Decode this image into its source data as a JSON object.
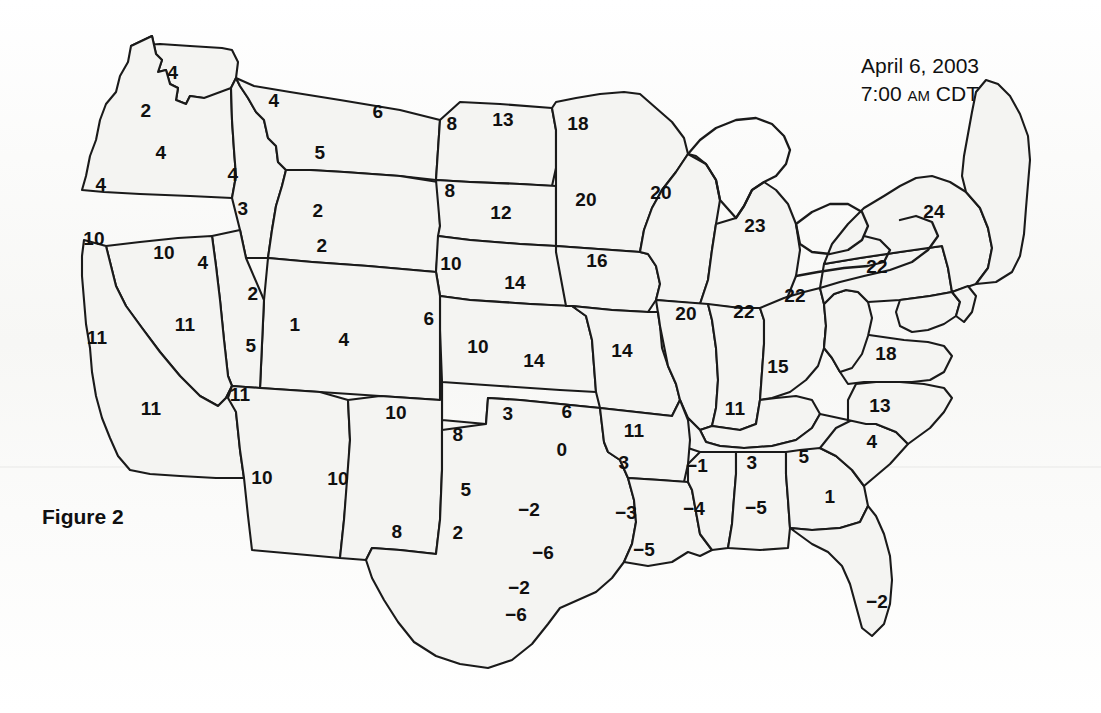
{
  "figure": {
    "caption": "Figure 2"
  },
  "header": {
    "date": "April 6, 2003",
    "time_value": "7:00",
    "time_meridiem": "AM",
    "time_zone": "CDT"
  },
  "chart_data": {
    "type": "map",
    "title": "April 6, 2003 7:00 AM CDT",
    "subtitle": "Figure 2",
    "region": "Contiguous United States",
    "projection": "albers-usa",
    "value_type": "station observation",
    "grid": false,
    "legend": null,
    "colors": {
      "land_fill": "#f4f4f2",
      "border_stroke": "#1a1a1a",
      "label_text": "#101010",
      "background": "#fdfdfc"
    },
    "labels": [
      {
        "id": "wa-n",
        "value": "4",
        "x": 173,
        "y": 72
      },
      {
        "id": "wa-w",
        "value": "2",
        "x": 146,
        "y": 110
      },
      {
        "id": "or-ne",
        "value": "4",
        "x": 161,
        "y": 152
      },
      {
        "id": "or-w",
        "value": "4",
        "x": 101,
        "y": 184
      },
      {
        "id": "id-n",
        "value": "4",
        "x": 233,
        "y": 174
      },
      {
        "id": "id-s",
        "value": "3",
        "x": 243,
        "y": 208
      },
      {
        "id": "mt-w",
        "value": "4",
        "x": 274,
        "y": 100
      },
      {
        "id": "mt-c",
        "value": "5",
        "x": 320,
        "y": 152
      },
      {
        "id": "mt-e",
        "value": "6",
        "x": 378,
        "y": 111
      },
      {
        "id": "nd-w",
        "value": "8",
        "x": 452,
        "y": 123
      },
      {
        "id": "nd-e",
        "value": "13",
        "x": 503,
        "y": 119
      },
      {
        "id": "mn-n",
        "value": "18",
        "x": 578,
        "y": 123
      },
      {
        "id": "sd-w",
        "value": "8",
        "x": 450,
        "y": 190
      },
      {
        "id": "sd-e",
        "value": "12",
        "x": 501,
        "y": 212
      },
      {
        "id": "mn-s",
        "value": "20",
        "x": 586,
        "y": 199
      },
      {
        "id": "wi-w",
        "value": "20",
        "x": 661,
        "y": 192
      },
      {
        "id": "mi-c",
        "value": "23",
        "x": 755,
        "y": 225
      },
      {
        "id": "ny-c",
        "value": "24",
        "x": 934,
        "y": 211
      },
      {
        "id": "ca-n",
        "value": "10",
        "x": 94,
        "y": 238
      },
      {
        "id": "nv-n",
        "value": "10",
        "x": 164,
        "y": 252
      },
      {
        "id": "ut-nw",
        "value": "4",
        "x": 203,
        "y": 262
      },
      {
        "id": "wy-w",
        "value": "2",
        "x": 318,
        "y": 210
      },
      {
        "id": "wy-sw",
        "value": "2",
        "x": 322,
        "y": 245
      },
      {
        "id": "ne-w",
        "value": "10",
        "x": 451,
        "y": 263
      },
      {
        "id": "ne-e",
        "value": "14",
        "x": 515,
        "y": 282
      },
      {
        "id": "ia-c",
        "value": "16",
        "x": 597,
        "y": 260
      },
      {
        "id": "pa-c",
        "value": "22",
        "x": 877,
        "y": 266
      },
      {
        "id": "ut-n",
        "value": "2",
        "x": 253,
        "y": 293
      },
      {
        "id": "ut-c",
        "value": "5",
        "x": 251,
        "y": 345
      },
      {
        "id": "co-nw",
        "value": "1",
        "x": 295,
        "y": 324
      },
      {
        "id": "co-c",
        "value": "4",
        "x": 344,
        "y": 339
      },
      {
        "id": "ks-ne",
        "value": "6",
        "x": 429,
        "y": 318
      },
      {
        "id": "nv-s",
        "value": "11",
        "x": 185,
        "y": 324
      },
      {
        "id": "ca-nc",
        "value": "11",
        "x": 97,
        "y": 337
      },
      {
        "id": "il-c",
        "value": "20",
        "x": 686,
        "y": 313
      },
      {
        "id": "in-c",
        "value": "22",
        "x": 744,
        "y": 311
      },
      {
        "id": "oh-c",
        "value": "22",
        "x": 795,
        "y": 295
      },
      {
        "id": "ks-w",
        "value": "10",
        "x": 478,
        "y": 346
      },
      {
        "id": "ks-c",
        "value": "14",
        "x": 534,
        "y": 360
      },
      {
        "id": "mo-c",
        "value": "14",
        "x": 622,
        "y": 350
      },
      {
        "id": "ky-c",
        "value": "15",
        "x": 778,
        "y": 366
      },
      {
        "id": "va-c",
        "value": "18",
        "x": 886,
        "y": 353
      },
      {
        "id": "ca-c",
        "value": "11",
        "x": 151,
        "y": 408
      },
      {
        "id": "az-n",
        "value": "11",
        "x": 240,
        "y": 394
      },
      {
        "id": "nm-nw",
        "value": "10",
        "x": 396,
        "y": 412
      },
      {
        "id": "ok-w",
        "value": "3",
        "x": 508,
        "y": 413
      },
      {
        "id": "ok-c",
        "value": "6",
        "x": 567,
        "y": 411
      },
      {
        "id": "ar-n",
        "value": "11",
        "x": 634,
        "y": 430
      },
      {
        "id": "tn-c",
        "value": "11",
        "x": 735,
        "y": 408
      },
      {
        "id": "nc-c",
        "value": "13",
        "x": 880,
        "y": 405
      },
      {
        "id": "tx-pan",
        "value": "8",
        "x": 458,
        "y": 434
      },
      {
        "id": "ok-s",
        "value": "0",
        "x": 562,
        "y": 449
      },
      {
        "id": "ar-s",
        "value": "3",
        "x": 624,
        "y": 462
      },
      {
        "id": "ms-n",
        "value": "-1",
        "x": 697,
        "y": 465
      },
      {
        "id": "al-n",
        "value": "3",
        "x": 752,
        "y": 462
      },
      {
        "id": "ga-n",
        "value": "5",
        "x": 804,
        "y": 456
      },
      {
        "id": "sc-c",
        "value": "4",
        "x": 872,
        "y": 441
      },
      {
        "id": "az-c",
        "value": "10",
        "x": 262,
        "y": 477
      },
      {
        "id": "nm-c",
        "value": "10",
        "x": 338,
        "y": 478
      },
      {
        "id": "tx-nw",
        "value": "5",
        "x": 466,
        "y": 489
      },
      {
        "id": "tx-n",
        "value": "-2",
        "x": 529,
        "y": 509
      },
      {
        "id": "la-n",
        "value": "-3",
        "x": 626,
        "y": 512
      },
      {
        "id": "ms-s",
        "value": "-4",
        "x": 694,
        "y": 508
      },
      {
        "id": "al-s",
        "value": "-5",
        "x": 756,
        "y": 507
      },
      {
        "id": "ga-c",
        "value": "1",
        "x": 830,
        "y": 496
      },
      {
        "id": "nm-s",
        "value": "8",
        "x": 397,
        "y": 531
      },
      {
        "id": "tx-w",
        "value": "2",
        "x": 458,
        "y": 532
      },
      {
        "id": "tx-c",
        "value": "-6",
        "x": 543,
        "y": 552
      },
      {
        "id": "la-s",
        "value": "-5",
        "x": 644,
        "y": 549
      },
      {
        "id": "tx-sc",
        "value": "-2",
        "x": 519,
        "y": 587
      },
      {
        "id": "tx-s",
        "value": "-6",
        "x": 516,
        "y": 614
      },
      {
        "id": "fl-c",
        "value": "-2",
        "x": 877,
        "y": 601
      }
    ]
  }
}
